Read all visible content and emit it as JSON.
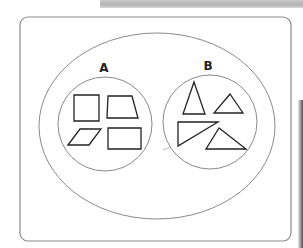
{
  "diagram": {
    "type": "set-diagram",
    "universal_set": {
      "label": ""
    },
    "sets": [
      {
        "id": "A",
        "label": "A",
        "members": [
          "square",
          "trapezoid",
          "parallelogram",
          "rectangle"
        ],
        "category": "quadrilaterals"
      },
      {
        "id": "B",
        "label": "B",
        "members": [
          "acute triangle (tall)",
          "small triangle",
          "right triangle",
          "obtuse triangle"
        ],
        "category": "triangles"
      }
    ],
    "colors": {
      "outline": "#888888",
      "shape_stroke": "#222222",
      "background": "#ffffff"
    }
  }
}
